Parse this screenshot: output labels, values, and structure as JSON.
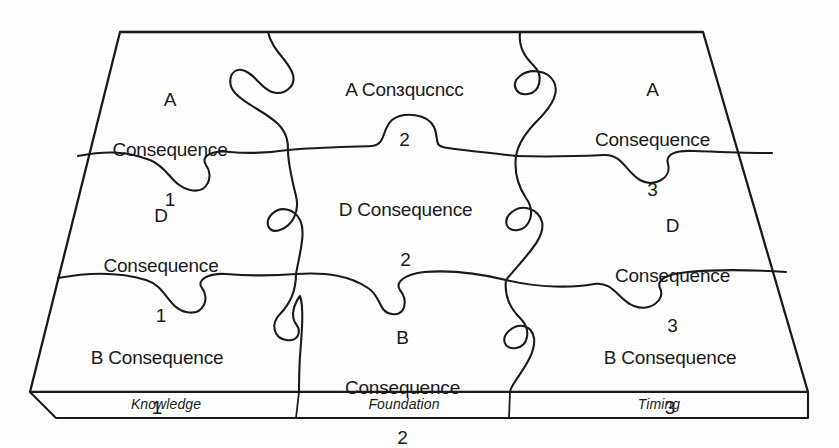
{
  "figure": {
    "type": "puzzle-matrix-diagram",
    "ink_color": "#1a1a1a",
    "background_color": "#ffffff",
    "rows": 3,
    "columns": 3
  },
  "pieces": [
    {
      "id": "a1",
      "row": 0,
      "col": 0,
      "line1": "A",
      "line2": "Consequence",
      "line3": "1"
    },
    {
      "id": "a2",
      "row": 0,
      "col": 1,
      "line1": "A Conɜqucncc",
      "line2": "",
      "line3": "2"
    },
    {
      "id": "a3",
      "row": 0,
      "col": 2,
      "line1": "A",
      "line2": "Consequence",
      "line3": "3"
    },
    {
      "id": "d1",
      "row": 1,
      "col": 0,
      "line1": "D",
      "line2": "Consequence",
      "line3": "1"
    },
    {
      "id": "d2",
      "row": 1,
      "col": 1,
      "line1": "D Consequence",
      "line2": "",
      "line3": "2"
    },
    {
      "id": "d3",
      "row": 1,
      "col": 2,
      "line1": "D",
      "line2": "Consequence",
      "line3": "3"
    },
    {
      "id": "b1",
      "row": 2,
      "col": 0,
      "line1": "B Consequence",
      "line2": "",
      "line3": "1"
    },
    {
      "id": "b2",
      "row": 2,
      "col": 1,
      "line1": "B",
      "line2": "Consequence",
      "line3": "2"
    },
    {
      "id": "b3",
      "row": 2,
      "col": 2,
      "line1": "B Consequence",
      "line2": "",
      "line3": "3"
    }
  ],
  "base": {
    "segments": [
      {
        "id": "knowledge",
        "label": "Knowledge"
      },
      {
        "id": "foundation",
        "label": "Foundation"
      },
      {
        "id": "timing",
        "label": "Timing"
      }
    ]
  }
}
